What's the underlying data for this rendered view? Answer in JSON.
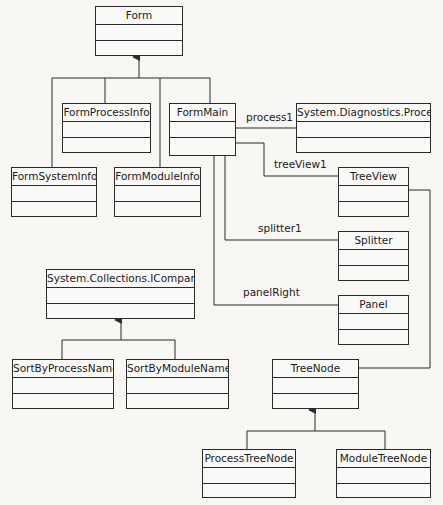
{
  "diagram": {
    "type": "uml-class-diagram",
    "classes": {
      "form": {
        "name": "Form"
      },
      "form_process_info": {
        "name": "FormProcessInfo"
      },
      "form_main": {
        "name": "FormMain"
      },
      "form_system_info": {
        "name": "FormSystemInfo"
      },
      "form_module_info": {
        "name": "FormModuleInfo"
      },
      "system_diagnostics_process": {
        "name": "System.Diagnostics.Process"
      },
      "tree_view": {
        "name": "TreeView"
      },
      "splitter": {
        "name": "Splitter"
      },
      "panel": {
        "name": "Panel"
      },
      "icomparer": {
        "name": "System.Collections.IComparer"
      },
      "sort_by_process_name": {
        "name": "SortByProcessName"
      },
      "sort_by_module_name": {
        "name": "SortByModuleName"
      },
      "tree_node": {
        "name": "TreeNode"
      },
      "process_tree_node": {
        "name": "ProcessTreeNode"
      },
      "module_tree_node": {
        "name": "ModuleTreeNode"
      }
    },
    "associations": {
      "process1": "process1",
      "tree_view1": "treeView1",
      "splitter1": "splitter1",
      "panel_right": "panelRight"
    },
    "inheritance": [
      {
        "parent": "Form",
        "children": [
          "FormSystemInfo",
          "FormProcessInfo",
          "FormModuleInfo",
          "FormMain"
        ]
      },
      {
        "parent": "System.Collections.IComparer",
        "children": [
          "SortByProcessName",
          "SortByModuleName"
        ]
      },
      {
        "parent": "TreeNode",
        "children": [
          "ProcessTreeNode",
          "ModuleTreeNode"
        ]
      }
    ],
    "other_links": [
      {
        "from": "TreeView",
        "to": "TreeNode"
      }
    ],
    "colors": {
      "line": "#2a2a2a",
      "background": "#f7f6f3"
    }
  }
}
